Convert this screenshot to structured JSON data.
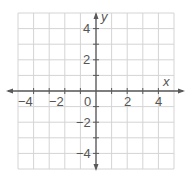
{
  "chart_data": {
    "type": "scatter",
    "title": "",
    "xlabel": "x",
    "ylabel": "y",
    "xlim": [
      -5,
      5
    ],
    "ylim": [
      -5,
      5
    ],
    "grid": true,
    "grid_step": 1,
    "x_ticks": [
      -4,
      -2,
      0,
      2,
      4
    ],
    "y_ticks": [
      -4,
      -2,
      2,
      4
    ],
    "x_tick_labels": [
      "−4",
      "−2",
      "2",
      "4"
    ],
    "y_tick_labels": [
      "4",
      "2",
      "−2",
      "−4"
    ],
    "origin_label": "0",
    "series": [],
    "legend": null
  },
  "colors": {
    "grid": "#d4d4d4",
    "axis": "#5a5a5a",
    "text": "#555555",
    "background": "#ffffff"
  },
  "labels": {
    "x_axis": "x",
    "y_axis": "y",
    "origin": "0",
    "xt_m4": "−4",
    "xt_m2": "−2",
    "xt_2": "2",
    "xt_4": "4",
    "yt_4": "4",
    "yt_2": "2",
    "yt_m2": "−2",
    "yt_m4": "−4"
  }
}
